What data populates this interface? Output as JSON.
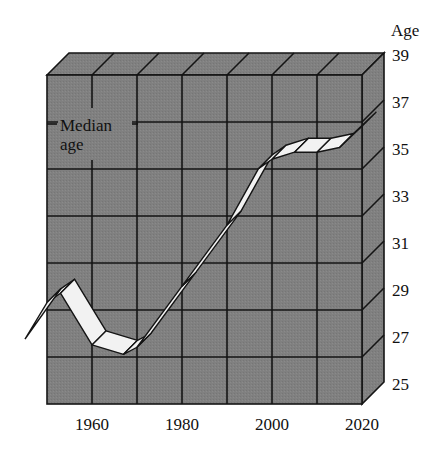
{
  "chart_data": {
    "type": "line",
    "title": "",
    "xlabel": "",
    "ylabel": "Age",
    "series": [
      {
        "name": "Median age",
        "x": [
          1950,
          1953,
          1960,
          1967,
          1970,
          1980,
          1990,
          1997,
          2000,
          2005,
          2010,
          2015,
          2020
        ],
        "values": [
          29.4,
          29.8,
          27.6,
          27.2,
          27.5,
          30.1,
          32.7,
          35.1,
          35.5,
          35.8,
          35.8,
          36.0,
          36.9
        ]
      }
    ],
    "x_ticks": [
      "1960",
      "1980",
      "2000",
      "2020"
    ],
    "y_ticks": [
      "25",
      "27",
      "29",
      "31",
      "33",
      "35",
      "37",
      "39"
    ],
    "xlim": [
      1950,
      2020
    ],
    "ylim": [
      25,
      39
    ],
    "grid": true,
    "style": "3d-box",
    "annotations": [
      {
        "text_line1": "Median",
        "text_line2": "age"
      }
    ],
    "colors": {
      "panel": "#7f7f7f",
      "panel_top": "#8a8a8a",
      "panel_side": "#858585",
      "ribbon": "#f2f2f2",
      "grid": "#141414"
    }
  }
}
